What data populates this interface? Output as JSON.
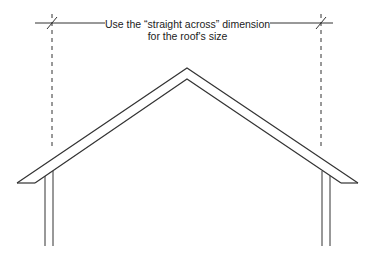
{
  "annotation": {
    "line1": "Use the “straight across” dimension",
    "line2": "for the roof's size"
  },
  "colors": {
    "stroke": "#333333",
    "background": "#ffffff"
  }
}
